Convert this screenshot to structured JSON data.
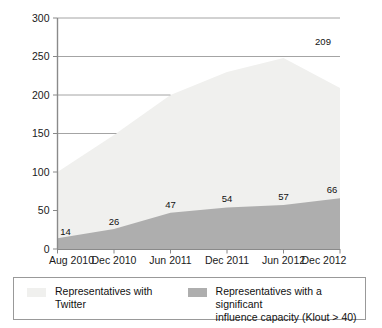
{
  "chart_data": {
    "type": "area",
    "title": "",
    "subtitle": "",
    "xlabel": "",
    "ylabel": "",
    "categories": [
      "Aug 2010",
      "Dec 2010",
      "Jun 2011",
      "Dec 2011",
      "Jun 2012",
      "Dec 2012"
    ],
    "ylim": [
      0,
      300
    ],
    "yticks": [
      0,
      50,
      100,
      150,
      200,
      250,
      300
    ],
    "ytick_labels": [
      "0",
      "50",
      "100",
      "150",
      "200",
      "250",
      "300"
    ],
    "grid": true,
    "grid_orientation": "horizontal",
    "stacked": false,
    "legend_position": "bottom",
    "series": [
      {
        "name": "Representatives with Twitter",
        "color": "#f0f0ee",
        "values": [
          100,
          148,
          200,
          230,
          248,
          209
        ],
        "labels": [
          "",
          "",
          "",
          "",
          "",
          "209"
        ],
        "label_shown_at_last_point_only": true,
        "end_value": 209
      },
      {
        "name": "Representatives with a significant influence capacity (Klout > 40)",
        "color": "#aeaeae",
        "values": [
          14,
          26,
          47,
          54,
          57,
          66
        ],
        "labels": [
          "14",
          "26",
          "47",
          "54",
          "57",
          "66"
        ]
      }
    ]
  },
  "axes": {
    "y": {
      "ticks": [
        {
          "value": 300,
          "label": "300"
        },
        {
          "value": 250,
          "label": "250"
        },
        {
          "value": 200,
          "label": "200"
        },
        {
          "value": 150,
          "label": "150"
        },
        {
          "value": 100,
          "label": "100"
        },
        {
          "value": 50,
          "label": "50"
        },
        {
          "value": 0,
          "label": "0"
        }
      ]
    },
    "x": {
      "ticks": [
        {
          "label": "Aug 2010"
        },
        {
          "label": "Dec 2010"
        },
        {
          "label": "Jun 2011"
        },
        {
          "label": "Dec 2011"
        },
        {
          "label": "Jun 2012"
        },
        {
          "label": "Dec 2012"
        }
      ]
    }
  },
  "data_labels": {
    "dark": [
      "14",
      "26",
      "47",
      "54",
      "57",
      "66"
    ],
    "light_end": "209"
  },
  "legend": {
    "entries": [
      {
        "label": "Representatives with Twitter",
        "swatch": "light",
        "color": "#f0f0ee"
      },
      {
        "label": "Representatives with a significant\ninfluence capacity (Klout > 40)",
        "swatch": "dark",
        "color": "#aeaeae"
      }
    ]
  },
  "colors": {
    "light_area": "#f0f0ee",
    "dark_area": "#aeaeae",
    "axis": "#888888",
    "grid": "#9a9a9a",
    "text": "#111111",
    "legend_border": "#999999",
    "background": "#ffffff"
  }
}
